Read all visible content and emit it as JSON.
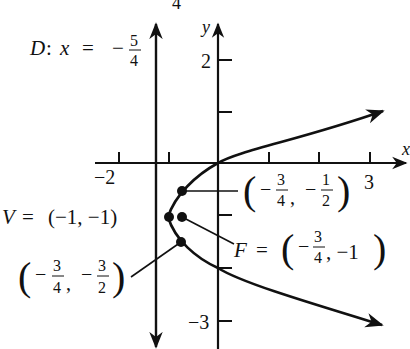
{
  "diagram": {
    "type": "parabola-graph",
    "equation_implied": "(y+1)^2 = x+1",
    "colors": {
      "ink": "#111111",
      "background": "#ffffff"
    },
    "stray_top_text": "4",
    "axes": {
      "x_label": "x",
      "y_label": "y",
      "x_tick_labels": [
        {
          "value": -2,
          "text": "−2"
        },
        {
          "value": 3,
          "text": "3"
        }
      ],
      "y_tick_labels": [
        {
          "value": 2,
          "text": "2"
        },
        {
          "value": -3,
          "text": "−3"
        }
      ]
    },
    "directrix": {
      "prefix": "D: x = −",
      "label_D": "D",
      "colon": ":",
      "var": "x",
      "equals": "=",
      "minus": "−",
      "num": "5",
      "den": "4"
    },
    "vertex": {
      "name": "V",
      "equals": "=",
      "coords_text": "(−1, −1)"
    },
    "focus": {
      "name": "F",
      "equals": "=",
      "minus": "−",
      "num": "3",
      "den": "4",
      "y_text": ", −1"
    },
    "point_upper": {
      "x_minus": "−",
      "x_num": "3",
      "x_den": "4",
      "y_minus": "−",
      "y_num": "1",
      "y_den": "2",
      "comma": ","
    },
    "point_lower": {
      "x_minus": "−",
      "x_num": "3",
      "x_den": "4",
      "y_minus": "−",
      "y_num": "3",
      "y_den": "2",
      "comma": ","
    },
    "paren_open": "(",
    "paren_close": ")"
  }
}
